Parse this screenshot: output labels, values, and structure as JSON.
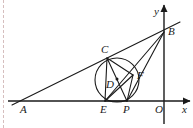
{
  "figure": {
    "stroke_color": "#1a1a1a",
    "background_color": "#ffffff",
    "margin_guide_color": "#c9a9a9",
    "width": 193,
    "height": 128
  },
  "axes": {
    "x_axis": {
      "label": "x",
      "label_x": 182,
      "label_y": 104,
      "y": 101,
      "x_start": 8,
      "x_end": 190,
      "arrow": "right"
    },
    "y_axis": {
      "label": "y",
      "label_x": 154,
      "label_y": 6,
      "x": 164,
      "y_start": 124,
      "y_end": 5,
      "arrow": "up"
    },
    "origin": {
      "label": "O",
      "label_x": 155,
      "label_y": 104,
      "x": 164,
      "y": 101
    }
  },
  "points": [
    {
      "id": "A",
      "label": "A",
      "x": 25,
      "y": 101,
      "label_x": 20,
      "label_y": 104,
      "dot": false
    },
    {
      "id": "B",
      "label": "B",
      "x": 164,
      "y": 32,
      "label_x": 168,
      "label_y": 26,
      "dot": false
    },
    {
      "id": "C",
      "label": "C",
      "x": 107,
      "y": 58,
      "label_x": 101,
      "label_y": 44,
      "dot": false
    },
    {
      "id": "D",
      "label": "D",
      "x": 117,
      "y": 79,
      "label_x": 106,
      "label_y": 79,
      "dot": true
    },
    {
      "id": "E",
      "label": "E",
      "x": 105,
      "y": 101,
      "label_x": 100,
      "label_y": 104,
      "dot": false
    },
    {
      "id": "F",
      "label": "F",
      "x": 133,
      "y": 75,
      "label_x": 137,
      "label_y": 70,
      "dot": false
    },
    {
      "id": "P",
      "label": "P",
      "x": 127,
      "y": 101,
      "label_x": 123,
      "label_y": 104,
      "dot": false
    }
  ],
  "circle": {
    "center_x": 117,
    "center_y": 80,
    "radius": 22,
    "label": "inscribed-circle"
  },
  "segments": [
    {
      "name": "line-A-to-B-through-C",
      "x1": 12,
      "y1": 105,
      "x2": 180,
      "y2": 22
    },
    {
      "name": "segment-B-to-E",
      "x1": 164,
      "y1": 32,
      "x2": 105,
      "y2": 101
    },
    {
      "name": "segment-B-to-P",
      "x1": 164,
      "y1": 32,
      "x2": 127,
      "y2": 101
    },
    {
      "name": "segment-C-to-E",
      "x1": 107,
      "y1": 58,
      "x2": 105,
      "y2": 101
    },
    {
      "name": "segment-C-to-F",
      "x1": 107,
      "y1": 58,
      "x2": 133,
      "y2": 75
    },
    {
      "name": "segment-C-to-P",
      "x1": 107,
      "y1": 58,
      "x2": 127,
      "y2": 101
    },
    {
      "name": "segment-E-to-F",
      "x1": 105,
      "y1": 101,
      "x2": 133,
      "y2": 75
    },
    {
      "name": "segment-E-to-P",
      "x1": 105,
      "y1": 101,
      "x2": 127,
      "y2": 101
    },
    {
      "name": "segment-P-to-F",
      "x1": 127,
      "y1": 101,
      "x2": 133,
      "y2": 75
    }
  ]
}
